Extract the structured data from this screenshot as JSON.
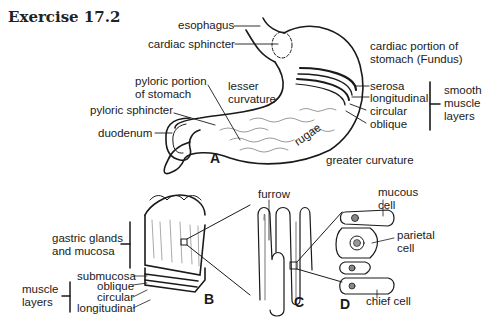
{
  "title": "Exercise 17.2",
  "panels": {
    "A": {
      "letter": "A",
      "labels": {
        "esophagus": "esophagus",
        "cardiac_sphincter": "cardiac sphincter",
        "cardiac_portion_1": "cardiac portion of",
        "cardiac_portion_2": "stomach (Fundus)",
        "pyloric_portion_1": "pyloric portion",
        "pyloric_portion_2": "of stomach",
        "lesser_curvature_1": "lesser",
        "lesser_curvature_2": "curvature",
        "pyloric_sphincter": "pyloric sphincter",
        "duodenum": "duodenum",
        "serosa": "serosa",
        "longitudinal": "longitudinal",
        "circular": "circular",
        "oblique": "oblique",
        "smooth_1": "smooth",
        "smooth_2": "muscle",
        "smooth_3": "layers",
        "rugae": "rugae",
        "greater_curvature": "greater curvature"
      }
    },
    "B": {
      "letter": "B",
      "labels": {
        "gastric_1": "gastric glands",
        "gastric_2": "and mucosa",
        "submucosa": "submucosa",
        "oblique": "oblique",
        "circular": "circular",
        "longitudinal": "longitudinal",
        "muscle_1": "muscle",
        "muscle_2": "layers"
      }
    },
    "C": {
      "letter": "C",
      "labels": {
        "furrow": "furrow"
      }
    },
    "D": {
      "letter": "D",
      "labels": {
        "mucous_1": "mucous",
        "mucous_2": "cell",
        "parietal_1": "parietal",
        "parietal_2": "cell",
        "chief": "chief cell"
      }
    }
  },
  "colors": {
    "ink": "#1a1a1a",
    "background": "#ffffff"
  }
}
